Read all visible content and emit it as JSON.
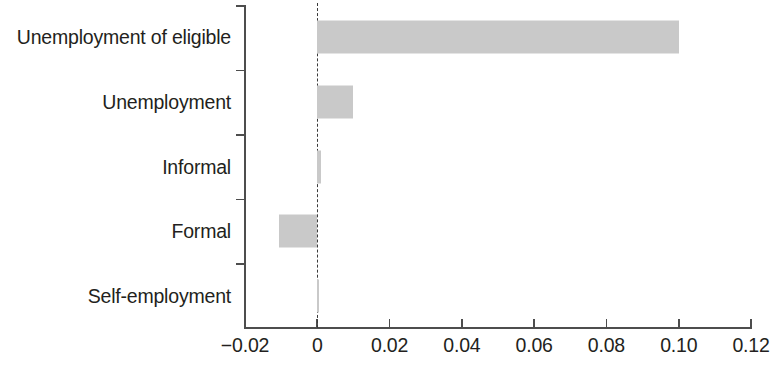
{
  "chart_data": {
    "type": "bar",
    "orientation": "horizontal",
    "title": "",
    "subtitle": "",
    "xlabel": "",
    "ylabel": "",
    "categories": [
      "Unemployment of eligible",
      "Unemployment",
      "Informal",
      "Formal",
      "Self-employment"
    ],
    "values": [
      0.1,
      0.01,
      0.001,
      -0.0105,
      0.0005
    ],
    "xlim": [
      -0.025,
      0.122
    ],
    "xticks": [
      -0.02,
      0,
      0.02,
      0.04,
      0.06,
      0.08,
      0.1,
      0.12
    ],
    "xtick_labels": [
      "−0.02",
      "0",
      "0.02",
      "0.04",
      "0.06",
      "0.08",
      "0.10",
      "0.12"
    ],
    "grid": false,
    "legend": null,
    "zero_reference_line": true,
    "bar_color": "#c9c9c9",
    "axis_color": "#4d4d4d",
    "text_color": "#231f20"
  },
  "axis": {
    "x_ticks": [
      {
        "label": "−0.02",
        "value": -0.02
      },
      {
        "label": "0",
        "value": 0
      },
      {
        "label": "0.02",
        "value": 0.02
      },
      {
        "label": "0.04",
        "value": 0.04
      },
      {
        "label": "0.06",
        "value": 0.06
      },
      {
        "label": "0.08",
        "value": 0.08
      },
      {
        "label": "0.10",
        "value": 0.1
      },
      {
        "label": "0.12",
        "value": 0.12
      }
    ]
  },
  "categories": [
    {
      "label": "Unemployment of eligible",
      "value": 0.1
    },
    {
      "label": "Unemployment",
      "value": 0.01
    },
    {
      "label": "Informal",
      "value": 0.001
    },
    {
      "label": "Formal",
      "value": -0.0105
    },
    {
      "label": "Self-employment",
      "value": 0.0005
    }
  ]
}
